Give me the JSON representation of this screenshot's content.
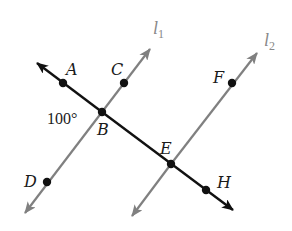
{
  "diagram": {
    "type": "geometry",
    "colors": {
      "transversal": "#111111",
      "parallel_lines": "#808080",
      "points": "#111111",
      "labels": "#1a1a1a",
      "line_labels": "#888888"
    },
    "lines": [
      {
        "name": "l1",
        "label_main": "l",
        "label_sub": "1",
        "through": [
          "D",
          "B",
          "C"
        ]
      },
      {
        "name": "l2",
        "label_main": "l",
        "label_sub": "2",
        "through": [
          "E",
          "F"
        ]
      },
      {
        "name": "transversal",
        "through": [
          "A",
          "B",
          "E",
          "H"
        ]
      }
    ],
    "points": {
      "A": {
        "label": "A"
      },
      "B": {
        "label": "B"
      },
      "C": {
        "label": "C"
      },
      "D": {
        "label": "D"
      },
      "E": {
        "label": "E"
      },
      "F": {
        "label": "F"
      },
      "H": {
        "label": "H"
      }
    },
    "angle": {
      "at": "B",
      "label": "100°",
      "between": [
        "A",
        "D"
      ]
    }
  }
}
